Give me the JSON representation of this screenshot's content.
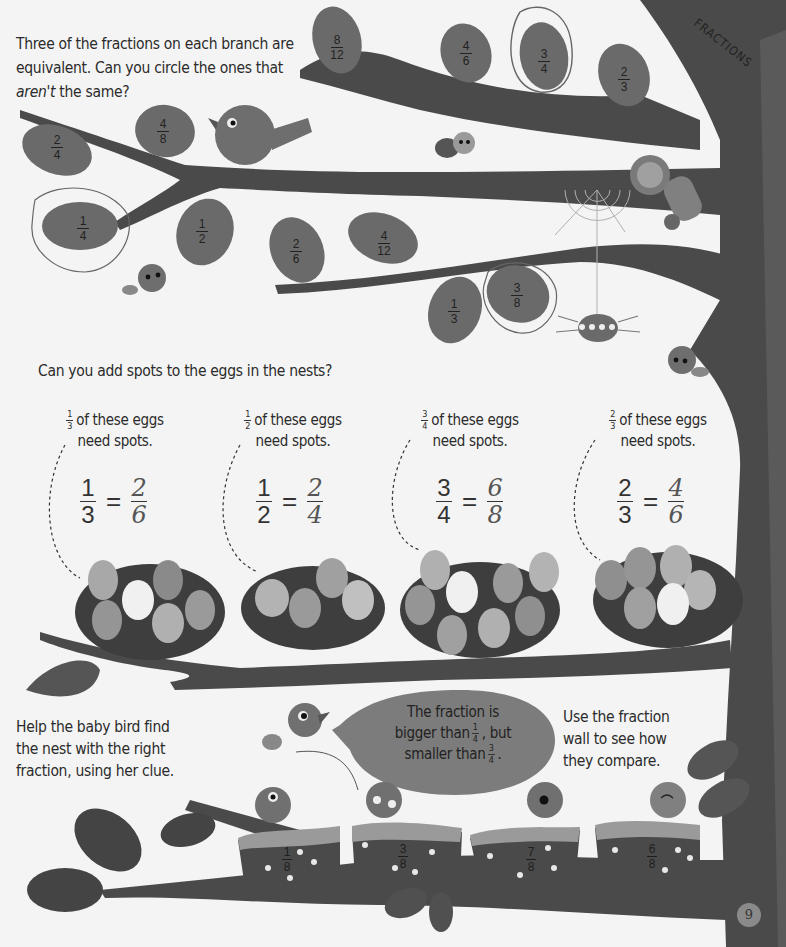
{
  "header": {
    "section_tag": "FRACTIONS",
    "page_number": "9"
  },
  "activity1": {
    "instruction_line1": "Three of the fractions on each branch are",
    "instruction_line2": "equivalent. Can you circle the ones that",
    "instruction_em": "aren't",
    "instruction_line3_rest": " the same?",
    "branches": [
      {
        "name": "top-branch",
        "leaves": [
          {
            "num": "8",
            "den": "12",
            "circled": false
          },
          {
            "num": "4",
            "den": "6",
            "circled": false
          },
          {
            "num": "3",
            "den": "4",
            "circled": true
          },
          {
            "num": "2",
            "den": "3",
            "circled": false
          }
        ]
      },
      {
        "name": "left-branch",
        "leaves": [
          {
            "num": "2",
            "den": "4",
            "circled": false
          },
          {
            "num": "4",
            "den": "8",
            "circled": false
          },
          {
            "num": "1",
            "den": "4",
            "circled": true
          },
          {
            "num": "1",
            "den": "2",
            "circled": false
          }
        ]
      },
      {
        "name": "middle-branch",
        "leaves": [
          {
            "num": "2",
            "den": "6",
            "circled": false
          },
          {
            "num": "4",
            "den": "12",
            "circled": false
          },
          {
            "num": "1",
            "den": "3",
            "circled": false
          },
          {
            "num": "3",
            "den": "8",
            "circled": true
          }
        ]
      }
    ]
  },
  "activity2": {
    "instruction": "Can you add spots to the eggs in the nests?",
    "clue_suffix_line1": "of these eggs",
    "clue_suffix_line2": "need spots.",
    "nests": [
      {
        "clue_num": "1",
        "clue_den": "3",
        "eq_left_num": "1",
        "eq_left_den": "3",
        "eq_right_num": "2",
        "eq_right_den": "6",
        "eggs": 6,
        "spotted": 2
      },
      {
        "clue_num": "1",
        "clue_den": "2",
        "eq_left_num": "1",
        "eq_left_den": "2",
        "eq_right_num": "2",
        "eq_right_den": "4",
        "eggs": 4,
        "spotted": 2
      },
      {
        "clue_num": "3",
        "clue_den": "4",
        "eq_left_num": "3",
        "eq_left_den": "4",
        "eq_right_num": "6",
        "eq_right_den": "8",
        "eggs": 8,
        "spotted": 6
      },
      {
        "clue_num": "2",
        "clue_den": "3",
        "eq_left_num": "2",
        "eq_left_den": "3",
        "eq_right_num": "4",
        "eq_right_den": "6",
        "eggs": 6,
        "spotted": 4
      }
    ],
    "equals": "="
  },
  "activity3": {
    "help_line1": "Help the baby bird find",
    "help_line2": "the nest with the right",
    "help_line3": "fraction, using her clue.",
    "bubble_line1": "The fraction is",
    "bubble_line2a": "bigger than",
    "bubble_frac1_num": "1",
    "bubble_frac1_den": "4",
    "bubble_line2b": ", but",
    "bubble_line3a": "smaller than",
    "bubble_frac2_num": "3",
    "bubble_frac2_den": "4",
    "bubble_line3b": ".",
    "hint_line1": "Use the fraction",
    "hint_line2": "wall to see how",
    "hint_line3": "they compare.",
    "nests": [
      {
        "num": "1",
        "den": "8"
      },
      {
        "num": "3",
        "den": "8"
      },
      {
        "num": "7",
        "den": "8"
      },
      {
        "num": "6",
        "den": "8"
      }
    ]
  },
  "colors": {
    "background": "#f4f4f4",
    "trunk": "#4a4a4a",
    "leaf": "#6a6a6a",
    "egg_light": "#a8a8a8",
    "bubble": "#7c7c7c",
    "text": "#2b2b2b"
  }
}
